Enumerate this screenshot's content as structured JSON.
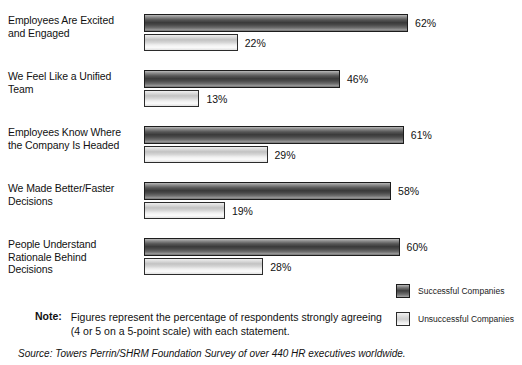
{
  "chart_data": {
    "type": "bar",
    "orientation": "horizontal",
    "title": "",
    "xlabel": "",
    "ylabel": "",
    "xlim": [
      0,
      62
    ],
    "grid": false,
    "legend_position": "bottom-right",
    "categories": [
      "Employees Are Excited and Engaged",
      "We Feel Like a Unified Team",
      "Employees Know Where the Company Is Headed",
      "We Made Better/Faster Decisions",
      "People Understand Rationale Behind Decisions"
    ],
    "series": [
      {
        "name": "Successful Companies",
        "values": [
          62,
          46,
          61,
          58,
          60
        ],
        "value_labels": [
          "62%",
          "46%",
          "61%",
          "58%",
          "60%"
        ],
        "color": "#3e3e3e"
      },
      {
        "name": "Unsuccessful Companies",
        "values": [
          22,
          13,
          29,
          19,
          28
        ],
        "value_labels": [
          "22%",
          "13%",
          "29%",
          "19%",
          "28%"
        ],
        "color": "#dcdcdc"
      }
    ]
  },
  "category_lines": [
    [
      "Employees Are Excited",
      "and Engaged"
    ],
    [
      "We Feel Like a Unified",
      "Team"
    ],
    [
      "Employees Know Where",
      "the Company Is Headed"
    ],
    [
      "We Made Better/Faster",
      "Decisions"
    ],
    [
      "People Understand",
      "Rationale Behind",
      "Decisions"
    ]
  ],
  "legend": {
    "items": [
      {
        "label": "Successful Companies",
        "swatch": "dark-gradient-swatch"
      },
      {
        "label": "Unsuccessful Companies",
        "swatch": "light-gradient-swatch"
      }
    ]
  },
  "note": {
    "label": "Note:",
    "line1": "Figures represent the percentage of respondents strongly agreeing",
    "line2": "(4 or 5 on a 5-point scale) with each statement."
  },
  "source": {
    "text": "Source: Towers Perrin/SHRM Foundation Survey of over 440 HR executives worldwide."
  },
  "layout": {
    "bar_origin_x": 144,
    "px_per_percent": 4.26,
    "group_tops": [
      14,
      70,
      126,
      182,
      238
    ],
    "dark_bar_height": 18,
    "light_bar_height": 17,
    "intra_group_gap": 2
  }
}
